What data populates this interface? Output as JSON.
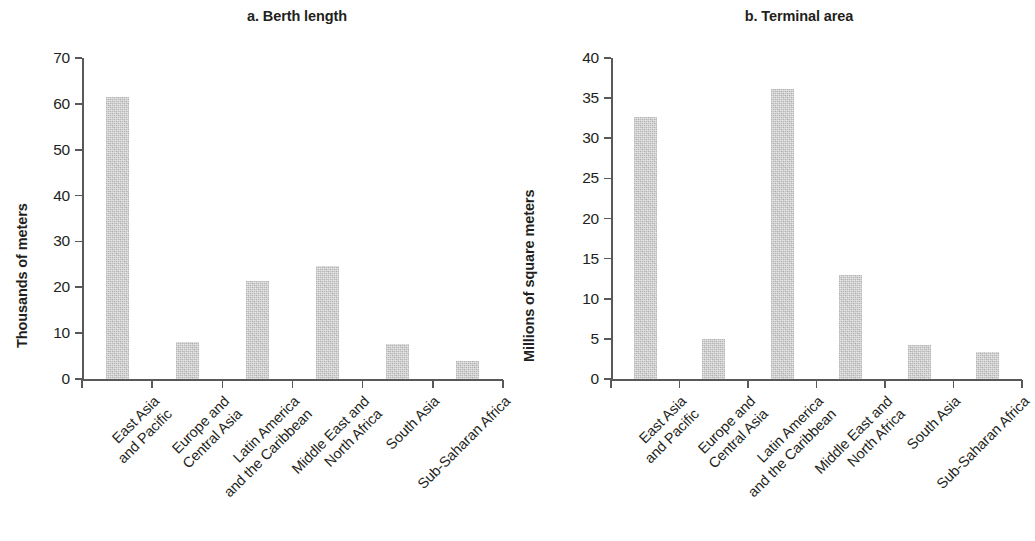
{
  "figure": {
    "background_color": "#ffffff",
    "bar_color": "#c6c6c6",
    "axis_color": "#58595b",
    "text_color": "#231f20"
  },
  "chart_data": [
    {
      "type": "bar",
      "panel_id": "a",
      "title": "a. Berth length",
      "xlabel": "",
      "ylabel": "Thousands of meters",
      "ylim": [
        0,
        70
      ],
      "yticks": [
        0,
        10,
        20,
        30,
        40,
        50,
        60,
        70
      ],
      "ytick_labels": [
        "0",
        "10",
        "20",
        "30",
        "40",
        "50",
        "60",
        "70"
      ],
      "grid": false,
      "legend": null,
      "categories": [
        "East Asia and Pacific",
        "Europe and Central Asia",
        "Latin America and the Caribbean",
        "Middle East and North Africa",
        "South Asia",
        "Sub-Saharan Africa"
      ],
      "category_lines": [
        [
          "East Asia",
          "and Pacific"
        ],
        [
          "Europe and",
          "Central Asia"
        ],
        [
          "Latin America",
          "and the Caribbean"
        ],
        [
          "Middle East and",
          "North Africa"
        ],
        [
          "South Asia",
          ""
        ],
        [
          "Sub-Saharan Africa",
          ""
        ]
      ],
      "values": [
        61.5,
        8.0,
        21.3,
        24.7,
        7.7,
        3.9
      ]
    },
    {
      "type": "bar",
      "panel_id": "b",
      "title": "b. Terminal area",
      "xlabel": "",
      "ylabel": "Millions of square meters",
      "ylim": [
        0,
        40
      ],
      "yticks": [
        0,
        5,
        10,
        15,
        20,
        25,
        30,
        35,
        40
      ],
      "ytick_labels": [
        "0",
        "5",
        "10",
        "15",
        "20",
        "25",
        "30",
        "35",
        "40"
      ],
      "grid": false,
      "legend": null,
      "categories": [
        "East Asia and Pacific",
        "Europe and Central Asia",
        "Latin America and the Caribbean",
        "Middle East and North Africa",
        "South Asia",
        "Sub-Saharan Africa"
      ],
      "category_lines": [
        [
          "East Asia",
          "and Pacific"
        ],
        [
          "Europe and",
          "Central Asia"
        ],
        [
          "Latin America",
          "and the Caribbean"
        ],
        [
          "Middle East and",
          "North Africa"
        ],
        [
          "South Asia",
          ""
        ],
        [
          "Sub-Saharan Africa",
          ""
        ]
      ],
      "values": [
        32.7,
        5.0,
        36.2,
        13.0,
        4.2,
        3.4
      ]
    }
  ]
}
